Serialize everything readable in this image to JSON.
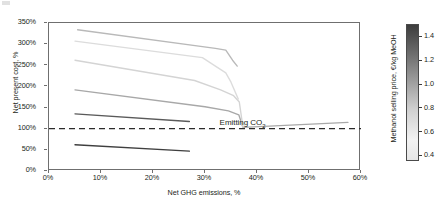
{
  "chart_data": {
    "type": "line",
    "title": "",
    "xlabel": "Net GHG emissions, %",
    "ylabel": "Net present cost, %",
    "xlim": [
      0,
      60
    ],
    "ylim": [
      0,
      350
    ],
    "xticks": [
      "0%",
      "10%",
      "20%",
      "30%",
      "40%",
      "50%",
      "60%"
    ],
    "xtick_values": [
      0,
      10,
      20,
      30,
      40,
      50,
      60
    ],
    "yticks": [
      "0%",
      "50%",
      "100%",
      "150%",
      "200%",
      "250%",
      "300%",
      "350%"
    ],
    "ytick_values": [
      0,
      50,
      100,
      150,
      200,
      250,
      300,
      350
    ],
    "grid": false,
    "legend": "colorbar-right",
    "reference_line": {
      "orientation": "horizontal",
      "y": 100,
      "style": "dashed",
      "label": "Emitting CO",
      "label_sub": "2",
      "label_x": 33,
      "label_y": 112
    },
    "colorbar": {
      "label": "Methanol selling price, €/kg MeOH",
      "ticks": [
        "0.4",
        "0.6",
        "0.8",
        "1.0",
        "1.2",
        "1.4"
      ],
      "tick_values": [
        0.4,
        0.6,
        0.8,
        1.0,
        1.2,
        1.4
      ],
      "vmin": 0.35,
      "vmax": 1.5,
      "low_color": "#f2f2f2",
      "high_color": "#3d3d3d"
    },
    "series": [
      {
        "name": "price-1.45",
        "color": "#3f3f3f",
        "price": 1.45,
        "points": [
          [
            5.0,
            62
          ],
          [
            27.0,
            47
          ]
        ]
      },
      {
        "name": "price-1.25",
        "color": "#5a5a5a",
        "price": 1.25,
        "points": [
          [
            5.0,
            135
          ],
          [
            27.0,
            117
          ]
        ]
      },
      {
        "name": "price-0.95",
        "color": "#a8a8a8",
        "price": 0.95,
        "points": [
          [
            5.0,
            192
          ],
          [
            30.0,
            152
          ],
          [
            34.5,
            142
          ],
          [
            36.5,
            133
          ],
          [
            37.3,
            103
          ],
          [
            57.5,
            115
          ]
        ]
      },
      {
        "name": "price-0.72",
        "color": "#d4d4d4",
        "price": 0.72,
        "points": [
          [
            5.0,
            262
          ],
          [
            28.0,
            214
          ],
          [
            33.0,
            192
          ],
          [
            35.5,
            178
          ],
          [
            36.6,
            163
          ],
          [
            37.3,
            103
          ]
        ]
      },
      {
        "name": "price-0.58",
        "color": "#dcdcdc",
        "price": 0.58,
        "points": [
          [
            5.0,
            307
          ],
          [
            29.5,
            268
          ],
          [
            32.0,
            248
          ],
          [
            34.0,
            232
          ],
          [
            35.0,
            210
          ],
          [
            36.4,
            170
          ]
        ]
      },
      {
        "name": "price-0.45",
        "color": "#b9b9b9",
        "price": 0.45,
        "points": [
          [
            5.5,
            334
          ],
          [
            32.0,
            290
          ],
          [
            34.0,
            286
          ],
          [
            35.3,
            262
          ],
          [
            36.2,
            248
          ]
        ]
      }
    ]
  }
}
